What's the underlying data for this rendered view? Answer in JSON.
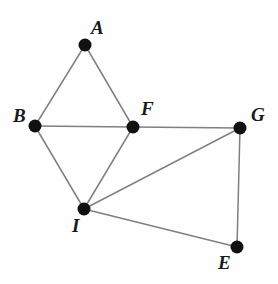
{
  "figure": {
    "kind": "geometry-graph-diagram",
    "background_color": "#fefefe",
    "edge_color": "#808080",
    "vertex_color": "#111111",
    "label_color": "#1a1a1a",
    "edge_width": 1.5,
    "vertex_radius": 6.5,
    "width": 278,
    "height": 284
  },
  "vertices": [
    {
      "id": "A",
      "label": "A",
      "x": 85,
      "y": 45,
      "label_x": 91,
      "label_y": 18
    },
    {
      "id": "B",
      "label": "B",
      "x": 35,
      "y": 126,
      "label_x": 13,
      "label_y": 106
    },
    {
      "id": "F",
      "label": "F",
      "x": 133,
      "y": 127,
      "label_x": 141,
      "label_y": 99
    },
    {
      "id": "G",
      "label": "G",
      "x": 240,
      "y": 128,
      "label_x": 251,
      "label_y": 105
    },
    {
      "id": "I",
      "label": "I",
      "x": 84,
      "y": 209,
      "label_x": 72,
      "label_y": 216
    },
    {
      "id": "E",
      "label": "E",
      "x": 237,
      "y": 247,
      "label_x": 218,
      "label_y": 253
    }
  ],
  "edges": [
    {
      "from": "A",
      "to": "B"
    },
    {
      "from": "A",
      "to": "F"
    },
    {
      "from": "B",
      "to": "F"
    },
    {
      "from": "B",
      "to": "I"
    },
    {
      "from": "F",
      "to": "I"
    },
    {
      "from": "F",
      "to": "G"
    },
    {
      "from": "I",
      "to": "G"
    },
    {
      "from": "I",
      "to": "E"
    },
    {
      "from": "G",
      "to": "E"
    }
  ]
}
